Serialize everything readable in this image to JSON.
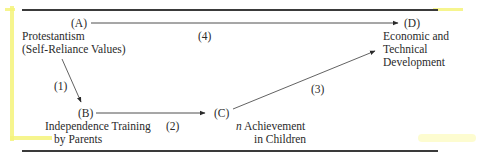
{
  "diagram": {
    "nodes": {
      "A": {
        "label": "(A)",
        "lines": [
          "Protestantism",
          "(Self-Reliance Values)"
        ]
      },
      "B": {
        "label": "(B)",
        "lines": [
          "Independence Training",
          "by Parents"
        ]
      },
      "C": {
        "label": "(C)",
        "lines_prefix": "n",
        "lines": [
          " Achievement",
          "in Children"
        ]
      },
      "D": {
        "label": "(D)",
        "lines": [
          "Economic and",
          "Technical",
          "Development"
        ]
      }
    },
    "edges": [
      {
        "id": "1",
        "label": "(1)",
        "from": "A",
        "to": "B"
      },
      {
        "id": "2",
        "label": "(2)",
        "from": "B",
        "to": "C"
      },
      {
        "id": "3",
        "label": "(3)",
        "from": "C",
        "to": "D"
      },
      {
        "id": "4",
        "label": "(4)",
        "from": "A",
        "to": "D"
      }
    ]
  },
  "colors": {
    "ink": "#2a2a2a",
    "rule": "#3a3a3a",
    "highlighter": "#f5f37a"
  }
}
